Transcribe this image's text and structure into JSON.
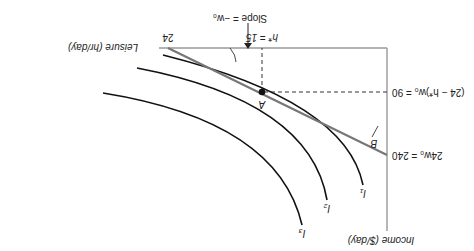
{
  "diagram": {
    "orientation": "rotated 180 degrees",
    "axes": {
      "vertical_label": "Income ($/day)",
      "horizontal_label": "Leisure (hr/day)",
      "leisure_max_tick": "24"
    },
    "budget_line": {
      "label": "B",
      "income_intercept_label": "24w₀ = 240",
      "slope_label": "Slope = −w₀",
      "color": "#777777"
    },
    "optimum": {
      "point_label": "A",
      "leisure_label": "h* = 15",
      "income_label": "(24 − h*)w₀ = 90"
    },
    "indifference_curves": [
      {
        "label": "I₁"
      },
      {
        "label": "I₂"
      },
      {
        "label": "I₃"
      }
    ]
  }
}
